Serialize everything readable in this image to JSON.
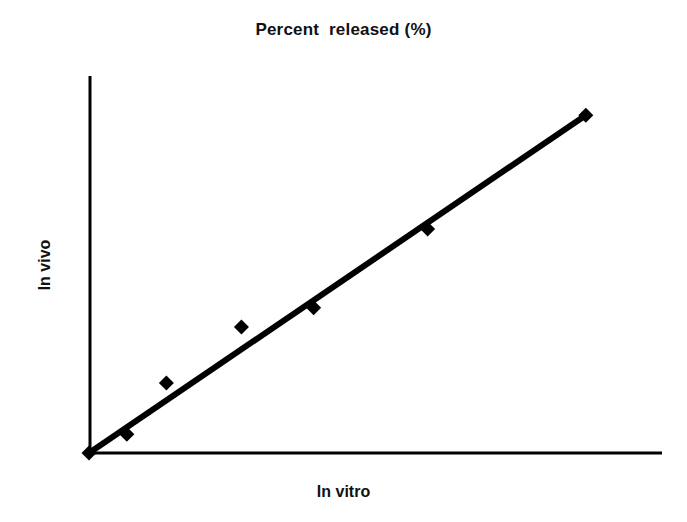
{
  "chart_data": {
    "type": "scatter",
    "title": "Percent  released (%)",
    "xlabel": "In vitro",
    "ylabel": "In vivo",
    "grid": false,
    "legend": null,
    "axes": {
      "x_ticks": [],
      "y_ticks": [],
      "xlim": [
        0,
        100
      ],
      "ylim": [
        0,
        100
      ],
      "origin_at_zero": true,
      "axis_style": "two-spine-L"
    },
    "marker": {
      "shape": "diamond",
      "color": "#000000",
      "size_px": 15
    },
    "trendline": {
      "type": "line",
      "color": "#000000",
      "width_px": 6,
      "from": {
        "x": 0,
        "y": 0
      },
      "to": {
        "x": 86.7,
        "y": 89.6
      }
    },
    "series": [
      {
        "name": "In vitro vs In vivo correlation",
        "points": [
          {
            "x": 0.0,
            "y": 0.0
          },
          {
            "x": 6.6,
            "y": 5.0
          },
          {
            "x": 13.5,
            "y": 18.6
          },
          {
            "x": 26.6,
            "y": 33.4
          },
          {
            "x": 39.2,
            "y": 38.5
          },
          {
            "x": 59.1,
            "y": 59.4
          },
          {
            "x": 86.7,
            "y": 89.6
          }
        ]
      }
    ]
  },
  "labels": {
    "title": "Percent  released (%)",
    "x_axis": "In vitro",
    "y_axis": "In vivo"
  },
  "colors": {
    "background": "#ffffff",
    "ink": "#000000",
    "text": "#111111"
  }
}
